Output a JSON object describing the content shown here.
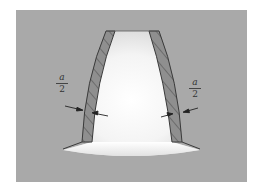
{
  "diagram": {
    "type": "gear-tooth-cross-section",
    "colors": {
      "background_panel": "#a9a9a9",
      "tooth_fill_light": "#ffffff",
      "hatched_layer": "#8e8e8e",
      "outline": "#3a3a3a"
    },
    "labels": {
      "left": {
        "numerator": "a",
        "denominator": "2"
      },
      "right": {
        "numerator": "a",
        "denominator": "2"
      }
    },
    "annotations": [
      {
        "id": "left-thickness",
        "text": "a/2",
        "side": "left"
      },
      {
        "id": "right-thickness",
        "text": "a/2",
        "side": "right"
      }
    ]
  }
}
